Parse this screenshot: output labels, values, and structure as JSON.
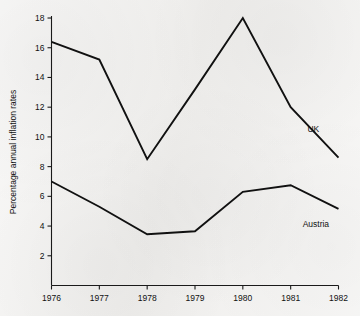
{
  "chart_data": {
    "type": "line",
    "title": "",
    "xlabel": "",
    "ylabel": "Percentage annual inflation rates",
    "categories": [
      "1976",
      "1977",
      "1978",
      "1979",
      "1980",
      "1981",
      "1982"
    ],
    "x": [
      1976,
      1977,
      1978,
      1979,
      1980,
      1981,
      1982
    ],
    "xlim": [
      1976,
      1982
    ],
    "ylim": [
      0,
      18
    ],
    "grid": false,
    "legend_position": "inline-right-of-series",
    "y_ticks": [
      2,
      4,
      6,
      8,
      10,
      12,
      14,
      16,
      18
    ],
    "y_tick_labels": [
      "2",
      "4",
      "6",
      "8",
      "10",
      "12",
      "14",
      "16",
      "18"
    ],
    "x_ticks": [
      1976,
      1977,
      1978,
      1979,
      1980,
      1981,
      1982
    ],
    "x_tick_labels": [
      "1976",
      "1977",
      "1978",
      "1979",
      "1980",
      "1981",
      "1982"
    ],
    "series": [
      {
        "name": "UK",
        "label": "UK",
        "color": "#111111",
        "values": [
          16.4,
          15.2,
          8.5,
          13.2,
          18.0,
          12.0,
          8.6
        ],
        "label_position": {
          "x": 1981.35,
          "y": 10.3
        }
      },
      {
        "name": "Austria",
        "label": "Austria",
        "color": "#111111",
        "values": [
          7.0,
          5.3,
          3.45,
          3.65,
          6.3,
          6.75,
          5.15
        ],
        "label_position": {
          "x": 1981.25,
          "y": 3.95
        }
      }
    ],
    "annotations": []
  },
  "colors": {
    "background": "#f3f2f0",
    "ink": "#111111",
    "axis": "#1a1a1a"
  }
}
